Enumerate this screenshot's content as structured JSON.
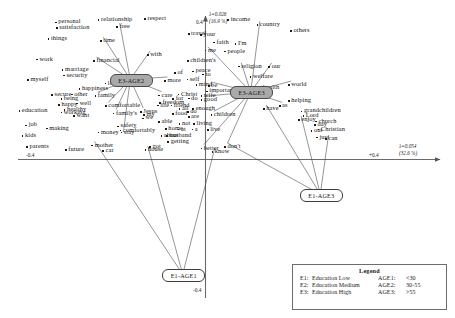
{
  "chart_data": {
    "type": "scatter",
    "title": "",
    "subtitle": "",
    "xlabel": "",
    "ylabel": "",
    "grid": false,
    "axes": {
      "horizontal": {
        "eigenvalue_label": "λ=0.054",
        "inertia_label": "(32.6 %)",
        "left_tick": "-0.4",
        "right_tick": "+0.4"
      },
      "vertical": {
        "eigenvalue_label": "λ=0.028",
        "inertia_label": "(16.9 %)",
        "top_tick": "0.4",
        "bottom_tick": "-0.4"
      }
    },
    "group_points": [
      {
        "label": "E3-AGE2",
        "x": -0.175,
        "y": 0.243,
        "style": "shaded"
      },
      {
        "label": "E3-AGE3",
        "x": 0.105,
        "y": 0.205,
        "style": "shaded"
      },
      {
        "label": "E1-AGE3",
        "x": 0.267,
        "y": -0.105,
        "style": "plain"
      },
      {
        "label": "E1-AGE1",
        "x": -0.053,
        "y": -0.348,
        "style": "plain"
      }
    ],
    "word_points": [
      {
        "text": "personal",
        "x": 0.128,
        "y": 0.058
      },
      {
        "text": "satisfaction",
        "x": 0.13,
        "y": 0.075
      },
      {
        "text": "relationship",
        "x": 0.222,
        "y": 0.05
      },
      {
        "text": "respect",
        "x": 0.324,
        "y": 0.048
      },
      {
        "text": "free",
        "x": 0.263,
        "y": 0.073
      },
      {
        "text": "things",
        "x": 0.112,
        "y": 0.11
      },
      {
        "text": "time",
        "x": 0.227,
        "y": 0.117
      },
      {
        "text": "travel",
        "x": 0.42,
        "y": 0.095
      },
      {
        "text": "your",
        "x": 0.447,
        "y": 0.098
      },
      {
        "text": "income",
        "x": 0.507,
        "y": 0.05
      },
      {
        "text": "country",
        "x": 0.571,
        "y": 0.067
      },
      {
        "text": "others",
        "x": 0.645,
        "y": 0.085
      },
      {
        "text": "faith",
        "x": 0.476,
        "y": 0.122
      },
      {
        "text": "I'm",
        "x": 0.523,
        "y": 0.126
      },
      {
        "text": "me",
        "x": 0.457,
        "y": 0.147
      },
      {
        "text": "people",
        "x": 0.5,
        "y": 0.15
      },
      {
        "text": "work",
        "x": 0.087,
        "y": 0.175
      },
      {
        "text": "with",
        "x": 0.33,
        "y": 0.16
      },
      {
        "text": "financial",
        "x": 0.212,
        "y": 0.18
      },
      {
        "text": "children's",
        "x": 0.418,
        "y": 0.18
      },
      {
        "text": "our",
        "x": 0.597,
        "y": 0.198
      },
      {
        "text": "religion",
        "x": 0.53,
        "y": 0.197
      },
      {
        "text": "marriage",
        "x": 0.143,
        "y": 0.207
      },
      {
        "text": "security",
        "x": 0.146,
        "y": 0.225
      },
      {
        "text": "myself",
        "x": 0.067,
        "y": 0.24
      },
      {
        "text": "peace",
        "x": 0.43,
        "y": 0.212
      },
      {
        "text": "to",
        "x": 0.452,
        "y": 0.222
      },
      {
        "text": "of",
        "x": 0.39,
        "y": 0.218
      },
      {
        "text": "more",
        "x": 0.368,
        "y": 0.242
      },
      {
        "text": "self",
        "x": 0.417,
        "y": 0.238
      },
      {
        "text": "welfare",
        "x": 0.556,
        "y": 0.23
      },
      {
        "text": "love",
        "x": 0.237,
        "y": 0.25
      },
      {
        "text": "in",
        "x": 0.252,
        "y": 0.238
      },
      {
        "text": "mind",
        "x": 0.437,
        "y": 0.255
      },
      {
        "text": "be",
        "x": 0.464,
        "y": 0.258
      },
      {
        "text": "happiness",
        "x": 0.18,
        "y": 0.268
      },
      {
        "text": "health",
        "x": 0.578,
        "y": 0.263
      },
      {
        "text": "world",
        "x": 0.64,
        "y": 0.255
      },
      {
        "text": "important",
        "x": 0.46,
        "y": 0.275
      },
      {
        "text": "secure",
        "x": 0.12,
        "y": 0.287
      },
      {
        "text": "other",
        "x": 0.163,
        "y": 0.285
      },
      {
        "text": "family",
        "x": 0.215,
        "y": 0.29
      },
      {
        "text": "care",
        "x": 0.355,
        "y": 0.288
      },
      {
        "text": "Christ",
        "x": 0.398,
        "y": 0.285
      },
      {
        "text": "wife",
        "x": 0.448,
        "y": 0.29
      },
      {
        "text": "being",
        "x": 0.14,
        "y": 0.3
      },
      {
        "text": "happy",
        "x": 0.135,
        "y": 0.318
      },
      {
        "text": "well",
        "x": 0.175,
        "y": 0.313
      },
      {
        "text": "comfortable",
        "x": 0.238,
        "y": 0.322
      },
      {
        "text": "for",
        "x": 0.386,
        "y": 0.3
      },
      {
        "text": "do",
        "x": 0.42,
        "y": 0.298
      },
      {
        "text": "good",
        "x": 0.448,
        "y": 0.303
      },
      {
        "text": "freedom",
        "x": 0.357,
        "y": 0.312
      },
      {
        "text": "helping",
        "x": 0.64,
        "y": 0.305
      },
      {
        "text": "education",
        "x": 0.048,
        "y": 0.337
      },
      {
        "text": "healthy",
        "x": 0.147,
        "y": 0.333
      },
      {
        "text": "working",
        "x": 0.14,
        "y": 0.342
      },
      {
        "text": "want",
        "x": 0.168,
        "y": 0.352
      },
      {
        "text": "family's",
        "x": 0.255,
        "y": 0.345
      },
      {
        "text": "Jesus",
        "x": 0.315,
        "y": 0.34
      },
      {
        "text": "my",
        "x": 0.322,
        "y": 0.35
      },
      {
        "text": "we",
        "x": 0.32,
        "y": 0.36
      },
      {
        "text": "friend",
        "x": 0.382,
        "y": 0.32
      },
      {
        "text": "life",
        "x": 0.352,
        "y": 0.32
      },
      {
        "text": "all",
        "x": 0.4,
        "y": 0.33
      },
      {
        "text": "enough",
        "x": 0.43,
        "y": 0.33
      },
      {
        "text": "do",
        "x": 0.418,
        "y": 0.34
      },
      {
        "text": "food",
        "x": 0.385,
        "y": 0.347
      },
      {
        "text": "are",
        "x": 0.42,
        "y": 0.355
      },
      {
        "text": "children",
        "x": 0.47,
        "y": 0.35
      },
      {
        "text": "have",
        "x": 0.585,
        "y": 0.33
      },
      {
        "text": "as",
        "x": 0.62,
        "y": 0.322
      },
      {
        "text": "grandchildren",
        "x": 0.668,
        "y": 0.338
      },
      {
        "text": "Lord",
        "x": 0.672,
        "y": 0.352
      },
      {
        "text": "enjoy",
        "x": 0.662,
        "y": 0.365
      },
      {
        "text": "church",
        "x": 0.7,
        "y": 0.37
      },
      {
        "text": "day",
        "x": 0.698,
        "y": 0.38
      },
      {
        "text": "Christian",
        "x": 0.705,
        "y": 0.395
      },
      {
        "text": "able",
        "x": 0.355,
        "y": 0.372
      },
      {
        "text": "safety",
        "x": 0.265,
        "y": 0.385
      },
      {
        "text": "not",
        "x": 0.4,
        "y": 0.378
      },
      {
        "text": "living",
        "x": 0.432,
        "y": 0.378
      },
      {
        "text": "comfortably",
        "x": 0.27,
        "y": 0.398
      },
      {
        "text": "money",
        "x": 0.222,
        "y": 0.405
      },
      {
        "text": "stay",
        "x": 0.272,
        "y": 0.405
      },
      {
        "text": "home",
        "x": 0.37,
        "y": 0.393
      },
      {
        "text": "at",
        "x": 0.398,
        "y": 0.395
      },
      {
        "text": "a",
        "x": 0.428,
        "y": 0.395
      },
      {
        "text": "live",
        "x": 0.462,
        "y": 0.397
      },
      {
        "text": "out",
        "x": 0.69,
        "y": 0.4
      },
      {
        "text": "job",
        "x": 0.063,
        "y": 0.382
      },
      {
        "text": "making",
        "x": 0.108,
        "y": 0.392
      },
      {
        "text": "kids",
        "x": 0.055,
        "y": 0.415
      },
      {
        "text": "about",
        "x": 0.36,
        "y": 0.415
      },
      {
        "text": "husband",
        "x": 0.372,
        "y": 0.415
      },
      {
        "text": "can",
        "x": 0.722,
        "y": 0.425
      },
      {
        "text": "just",
        "x": 0.702,
        "y": 0.42
      },
      {
        "text": "getting",
        "x": 0.375,
        "y": 0.435
      },
      {
        "text": "mother",
        "x": 0.208,
        "y": 0.445
      },
      {
        "text": "parents",
        "x": 0.065,
        "y": 0.45
      },
      {
        "text": "future",
        "x": 0.15,
        "y": 0.46
      },
      {
        "text": "car",
        "x": 0.232,
        "y": 0.462
      },
      {
        "text": "got",
        "x": 0.335,
        "y": 0.45
      },
      {
        "text": "house",
        "x": 0.325,
        "y": 0.46
      },
      {
        "text": "don't",
        "x": 0.5,
        "y": 0.45
      },
      {
        "text": "better",
        "x": 0.448,
        "y": 0.455
      },
      {
        "text": "know",
        "x": 0.472,
        "y": 0.465
      }
    ]
  },
  "legend": {
    "title": "Legend",
    "rows": [
      {
        "code": "E1:",
        "desc": "Education Low",
        "age_code": "AGE1:",
        "range": "<30"
      },
      {
        "code": "E2:",
        "desc": "Education Medium",
        "age_code": "AGE2:",
        "range": "30-55"
      },
      {
        "code": "E3:",
        "desc": "Education High",
        "age_code": "AGE3:",
        "range": ">55"
      }
    ]
  }
}
